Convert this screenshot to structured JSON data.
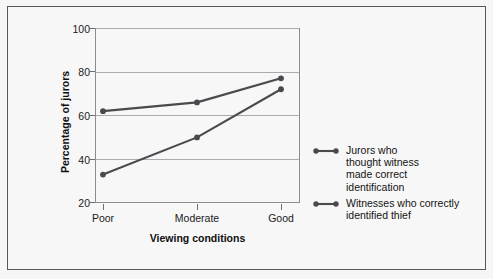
{
  "chart_data": {
    "type": "line",
    "title": "",
    "xlabel": "Viewing conditions",
    "ylabel": "Percentage of jurors",
    "categories": [
      "Poor",
      "Moderate",
      "Good"
    ],
    "ylim": [
      20,
      100
    ],
    "yticks": [
      20,
      40,
      60,
      80,
      100
    ],
    "grid": true,
    "legend_position": "right",
    "series": [
      {
        "name": "Jurors who\nthought witness\nmade correct\nidentification",
        "values": [
          62,
          66,
          77
        ],
        "color": "#4a4a4e"
      },
      {
        "name": "Witnesses who correctly\nidentified thief",
        "values": [
          33,
          50,
          72
        ],
        "color": "#4a4a4e"
      }
    ]
  },
  "axes": {
    "ytick_labels": [
      "100",
      "80",
      "60",
      "40",
      "20"
    ],
    "xtick_labels": [
      "Poor",
      "Moderate",
      "Good"
    ],
    "ylabel": "Percentage of jurors",
    "xlabel": "Viewing conditions"
  },
  "legend": {
    "entries": [
      {
        "label": "Jurors who\nthought witness\nmade correct\nidentification"
      },
      {
        "label": "Witnesses who correctly\nidentified thief"
      }
    ]
  },
  "colors": {
    "series_line": "#4a4a4e",
    "gridline": "#a9abae",
    "plot_border": "#8a8c90",
    "figure_border": "#56585c",
    "background": "#f7f7f7",
    "text": "#1b1b1b"
  }
}
